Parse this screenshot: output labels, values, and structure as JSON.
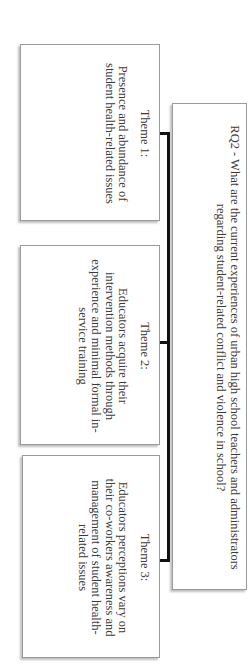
{
  "diagram": {
    "root": {
      "text": "RQ2 - What are the current experiences of urban high school teachers and administrators regarding student-related conflict and violence in school?"
    },
    "themes": [
      {
        "title": "Theme 1:",
        "text": "Presence and abundance of student health-related issues"
      },
      {
        "title": "Theme 2:",
        "text": "Educators acquire their intervention methods through experience and minimal formal in-service training"
      },
      {
        "title": "Theme 3:",
        "text": "Educators perceptions vary on their co-workers awareness and management of student health-related issues"
      }
    ],
    "colors": {
      "connector": "#111111",
      "box_border": "#9a9a9a",
      "text": "#3a3a3a"
    }
  }
}
